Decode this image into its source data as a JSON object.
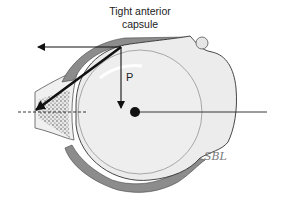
{
  "title": {
    "line1": "Tight anterior",
    "line2": "capsule"
  },
  "labels": {
    "force_vector": "P",
    "watermark": "SBL"
  },
  "colors": {
    "capsule": "#8c8c8c",
    "outline": "#333333",
    "humeral_head": "#ececec",
    "glenoid_bone": "#f2f2f2",
    "arrow": "#111111"
  }
}
